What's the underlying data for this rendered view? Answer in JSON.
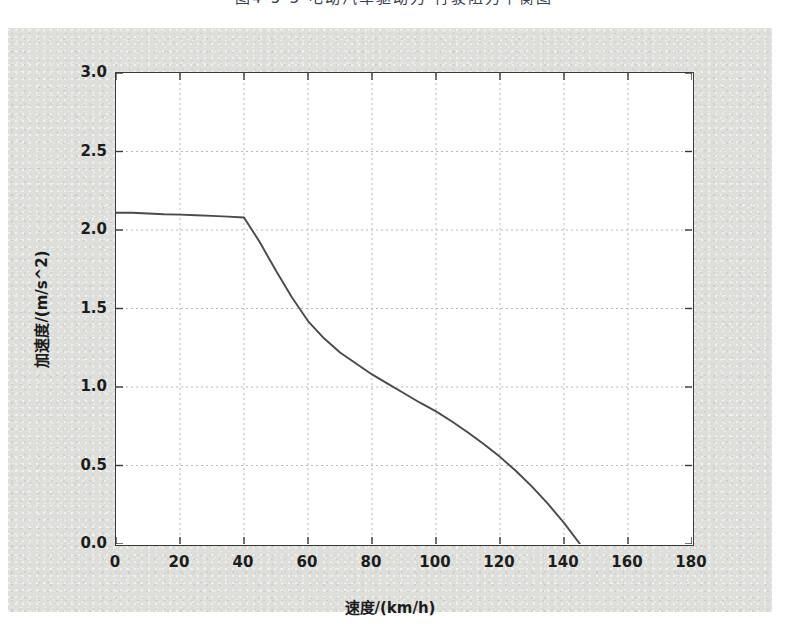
{
  "caption": "图4-5-3  电动汽车驱动力-行驶阻力平衡图",
  "figure": {
    "background_color": "#dedfdb",
    "plot_background_color": "#ffffff",
    "axis_color": "#3a3a3a",
    "grid_color": "#b9b9b9",
    "curve_color": "#4a4a4a"
  },
  "chart_data": {
    "type": "line",
    "title": "",
    "xlabel": "速度/(km/h)",
    "ylabel": "加速度/(m/s^2)",
    "xlim": [
      0,
      180
    ],
    "ylim": [
      0,
      3.0
    ],
    "xticks": [
      0,
      20,
      40,
      60,
      80,
      100,
      120,
      140,
      160,
      180
    ],
    "xtick_labels": [
      "0",
      "20",
      "40",
      "60",
      "80",
      "100",
      "120",
      "140",
      "160",
      "180"
    ],
    "yticks": [
      0.0,
      0.5,
      1.0,
      1.5,
      2.0,
      2.5,
      3.0
    ],
    "ytick_labels": [
      "0.0",
      "0.5",
      "1.0",
      "1.5",
      "2.0",
      "2.5",
      "3.0"
    ],
    "grid": true,
    "grid_style": "dashed",
    "legend": null,
    "series": [
      {
        "name": "加速度",
        "x": [
          0,
          5,
          10,
          15,
          20,
          25,
          30,
          35,
          40,
          45,
          50,
          55,
          60,
          65,
          70,
          75,
          80,
          85,
          90,
          95,
          100,
          105,
          110,
          115,
          120,
          125,
          130,
          135,
          140,
          145
        ],
        "y": [
          2.11,
          2.11,
          2.105,
          2.1,
          2.098,
          2.094,
          2.09,
          2.085,
          2.08,
          1.92,
          1.74,
          1.57,
          1.42,
          1.31,
          1.22,
          1.15,
          1.08,
          1.02,
          0.96,
          0.9,
          0.845,
          0.78,
          0.71,
          0.635,
          0.555,
          0.465,
          0.365,
          0.255,
          0.135,
          0.0
        ]
      }
    ],
    "annotations": [
      {
        "text": "恒转矩区终点",
        "x": 40,
        "y": 2.08
      },
      {
        "text": "最高车速",
        "x": 145,
        "y": 0.0
      }
    ]
  }
}
